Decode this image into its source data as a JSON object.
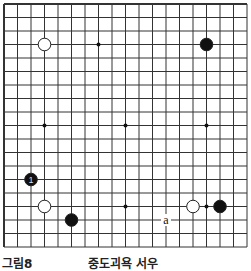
{
  "board": {
    "lines": 19,
    "origin_x": 4,
    "origin_y": 4,
    "spacing": 13.5,
    "line_color": "#333333",
    "star_points": [
      [
        7,
        3
      ],
      [
        3,
        9
      ],
      [
        9,
        9
      ],
      [
        15,
        9
      ],
      [
        9,
        15
      ],
      [
        15,
        15
      ]
    ],
    "stones": [
      {
        "color": "white",
        "col": 3,
        "row": 3
      },
      {
        "color": "black",
        "col": 15,
        "row": 3
      },
      {
        "color": "black",
        "col": 2,
        "row": 13,
        "label": "1"
      },
      {
        "color": "white",
        "col": 3,
        "row": 15
      },
      {
        "color": "black",
        "col": 5,
        "row": 16
      },
      {
        "color": "white",
        "col": 14,
        "row": 15
      },
      {
        "color": "black",
        "col": 16,
        "row": 15
      }
    ],
    "marks": [
      {
        "text": "a",
        "col": 12,
        "row": 16
      }
    ]
  },
  "caption": {
    "left": "그림8",
    "right": "중도괴욕 서우"
  }
}
